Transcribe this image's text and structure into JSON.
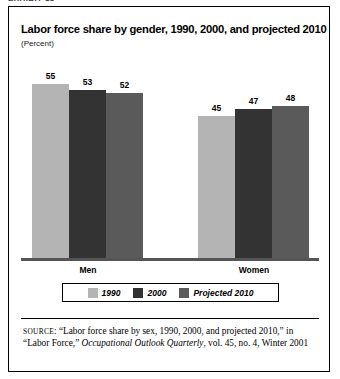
{
  "top_cropped_text": "EXHIBIT 13",
  "figure": {
    "title": "Labor force share by gender, 1990, 2000, and  projected 2010",
    "subtitle": "(Percent)"
  },
  "chart_data": {
    "type": "bar",
    "title": "Labor force share by gender, 1990, 2000, and  projected 2010",
    "subtitle": "(Percent)",
    "xlabel": "",
    "ylabel": "Percent",
    "ylim": [
      0,
      64
    ],
    "grid": false,
    "legend_position": "bottom",
    "categories": [
      "Men",
      "Women"
    ],
    "series": [
      {
        "name": "1990",
        "color": "#b4b4b4",
        "values": [
          55,
          45
        ]
      },
      {
        "name": "2000",
        "color": "#333333",
        "values": [
          53,
          47
        ]
      },
      {
        "name": "Projected 2010",
        "color": "#5a5a5a",
        "values": [
          52,
          48
        ]
      }
    ]
  },
  "legend": {
    "items": [
      {
        "label": "1990",
        "color": "#b4b4b4"
      },
      {
        "label": "2000",
        "color": "#333333"
      },
      {
        "label": "Projected 2010",
        "color": "#5a5a5a"
      }
    ]
  },
  "source": {
    "prefix": "SOURCE",
    "line1": ": “Labor force share by sex, 1990, 2000, and projected 2010,”",
    "line2_pre": "in “Labor Force,” ",
    "line2_italic": "Occupational Outlook Quarterly",
    "line2_post": ", vol. 45, no. 4,",
    "line3": "Winter 2001"
  }
}
